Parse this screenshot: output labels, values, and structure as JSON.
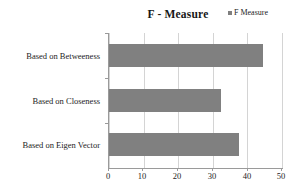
{
  "chart_data": {
    "type": "bar",
    "orientation": "horizontal",
    "title": "F - Measure",
    "xlabel": "",
    "ylabel": "",
    "categories": [
      "Based on Betweeness",
      "Based on Closeness",
      "Based on Eigen Vector"
    ],
    "series": [
      {
        "name": "F Measure",
        "values": [
          44.5,
          32.5,
          37.5
        ],
        "color": "#808080"
      }
    ],
    "xlim": [
      0,
      50
    ],
    "xticks": [
      0,
      10,
      20,
      30,
      40,
      50
    ],
    "xticklabels": [
      "0",
      "10",
      "20",
      "30",
      "40",
      "50"
    ],
    "grid": "vertical",
    "legend": {
      "position": "top-right",
      "entries": [
        {
          "label": "F Measure",
          "color": "#7f7f7f",
          "marker": "square"
        }
      ]
    }
  },
  "legend_marker_name": "legend-swatch-f-measure"
}
